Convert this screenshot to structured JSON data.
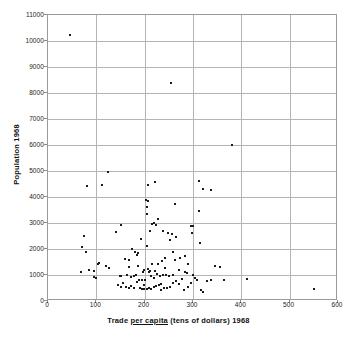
{
  "chart_data": {
    "type": "scatter",
    "title": "",
    "xlabel_parts": {
      "pre": "Trade ",
      "underlined": "per capita",
      "post": " (tens of dollars) 1968"
    },
    "xlabel": "Trade per capita (tens of dollars) 1968",
    "ylabel": "Population 1968",
    "xlim": [
      0,
      600
    ],
    "ylim": [
      0,
      11000
    ],
    "xticks": [
      0,
      100,
      200,
      300,
      400,
      500,
      600
    ],
    "yticks": [
      0,
      1000,
      2000,
      3000,
      4000,
      5000,
      6000,
      7000,
      8000,
      9000,
      10000,
      11000
    ],
    "xticklabels": [
      "0",
      "100",
      "200",
      "300",
      "400",
      "500",
      "600"
    ],
    "yticklabels": [
      "0",
      "1000",
      "2000",
      "3000",
      "4000",
      "5000",
      "6000",
      "7000",
      "8000",
      "9000",
      "10000",
      "11000"
    ],
    "grid": true,
    "legend": "none",
    "marker_color": "#1a1a1a",
    "grid_color": "#b4b4b4",
    "points": [
      [
        45,
        10250
      ],
      [
        255,
        8400
      ],
      [
        380,
        6000
      ],
      [
        125,
        4950
      ],
      [
        207,
        4480
      ],
      [
        222,
        4560
      ],
      [
        312,
        4620
      ],
      [
        80,
        4410
      ],
      [
        112,
        4470
      ],
      [
        320,
        4290
      ],
      [
        337,
        4280
      ],
      [
        203,
        3880
      ],
      [
        206,
        3840
      ],
      [
        205,
        3620
      ],
      [
        204,
        3330
      ],
      [
        262,
        3740
      ],
      [
        313,
        3470
      ],
      [
        228,
        3150
      ],
      [
        219,
        2990
      ],
      [
        224,
        2930
      ],
      [
        215,
        2950
      ],
      [
        152,
        2930
      ],
      [
        300,
        2880
      ],
      [
        295,
        2880
      ],
      [
        298,
        2610
      ],
      [
        211,
        2690
      ],
      [
        249,
        2600
      ],
      [
        257,
        2560
      ],
      [
        264,
        2450
      ],
      [
        238,
        2700
      ],
      [
        75,
        2490
      ],
      [
        140,
        2650
      ],
      [
        192,
        2390
      ],
      [
        253,
        2330
      ],
      [
        315,
        2240
      ],
      [
        71,
        2090
      ],
      [
        79,
        1900
      ],
      [
        174,
        1990
      ],
      [
        180,
        1870
      ],
      [
        186,
        1840
      ],
      [
        184,
        1780
      ],
      [
        259,
        1900
      ],
      [
        273,
        1660
      ],
      [
        283,
        1750
      ],
      [
        242,
        1660
      ],
      [
        262,
        1590
      ],
      [
        160,
        1620
      ],
      [
        168,
        1570
      ],
      [
        236,
        1520
      ],
      [
        228,
        1440
      ],
      [
        215,
        1430
      ],
      [
        206,
        1230
      ],
      [
        199,
        1200
      ],
      [
        103,
        1440
      ],
      [
        106,
        1470
      ],
      [
        119,
        1330
      ],
      [
        355,
        1300
      ],
      [
        345,
        1360
      ],
      [
        68,
        1120
      ],
      [
        85,
        1190
      ],
      [
        95,
        1160
      ],
      [
        283,
        1130
      ],
      [
        288,
        1060
      ],
      [
        301,
        1010
      ],
      [
        96,
        930
      ],
      [
        99,
        880
      ],
      [
        148,
        980
      ],
      [
        152,
        955
      ],
      [
        164,
        1010
      ],
      [
        171,
        930
      ],
      [
        177,
        960
      ],
      [
        183,
        1000
      ],
      [
        189,
        820
      ],
      [
        195,
        790
      ],
      [
        201,
        800
      ],
      [
        208,
        1100
      ],
      [
        213,
        960
      ],
      [
        219,
        880
      ],
      [
        226,
        1020
      ],
      [
        231,
        980
      ],
      [
        238,
        1000
      ],
      [
        244,
        1010
      ],
      [
        250,
        960
      ],
      [
        196,
        1110
      ],
      [
        210,
        1150
      ],
      [
        145,
        620
      ],
      [
        150,
        555
      ],
      [
        156,
        700
      ],
      [
        161,
        520
      ],
      [
        167,
        490
      ],
      [
        172,
        560
      ],
      [
        178,
        505
      ],
      [
        184,
        730
      ],
      [
        190,
        500
      ],
      [
        194,
        480
      ],
      [
        199,
        470
      ],
      [
        204,
        455
      ],
      [
        209,
        510
      ],
      [
        214,
        480
      ],
      [
        219,
        540
      ],
      [
        224,
        580
      ],
      [
        229,
        620
      ],
      [
        234,
        670
      ],
      [
        239,
        500
      ],
      [
        246,
        490
      ],
      [
        253,
        555
      ],
      [
        259,
        700
      ],
      [
        265,
        760
      ],
      [
        271,
        670
      ],
      [
        277,
        830
      ],
      [
        282,
        430
      ],
      [
        289,
        545
      ],
      [
        295,
        710
      ],
      [
        304,
        880
      ],
      [
        309,
        820
      ],
      [
        317,
        440
      ],
      [
        321,
        355
      ],
      [
        329,
        760
      ],
      [
        337,
        800
      ],
      [
        365,
        810
      ],
      [
        411,
        845
      ],
      [
        550,
        450
      ],
      [
        290,
        1440
      ],
      [
        271,
        1200
      ],
      [
        167,
        1290
      ],
      [
        127,
        1270
      ],
      [
        243,
        1270
      ],
      [
        258,
        1010
      ],
      [
        221,
        1160
      ],
      [
        198,
        600
      ],
      [
        233,
        440
      ],
      [
        205,
        2100
      ],
      [
        186,
        1340
      ]
    ]
  }
}
